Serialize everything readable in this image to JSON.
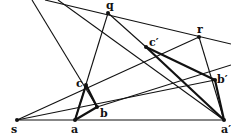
{
  "diagram": {
    "points": {
      "s": {
        "label": "s",
        "x": 17,
        "y": 120
      },
      "a": {
        "label": "a",
        "x": 75,
        "y": 120
      },
      "b": {
        "label": "b",
        "x": 97,
        "y": 107
      },
      "c": {
        "label": "c",
        "x": 86,
        "y": 85
      },
      "a_prime": {
        "label": "a′",
        "x": 224,
        "y": 120
      },
      "b_prime": {
        "label": "b′",
        "x": 215,
        "y": 80
      },
      "c_prime": {
        "label": "c′",
        "x": 146,
        "y": 47
      },
      "q": {
        "label": "q",
        "x": 108,
        "y": 13
      },
      "r": {
        "label": "r",
        "x": 199,
        "y": 37
      }
    },
    "colors": {
      "line": "#111111",
      "background": "#ffffff"
    }
  }
}
